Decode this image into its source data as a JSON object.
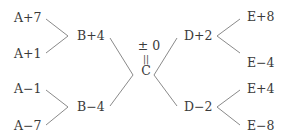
{
  "diagram": {
    "type": "tree",
    "left": {
      "top_group": {
        "leaves": [
          "A+7",
          "A+1"
        ],
        "node": "B+4"
      },
      "bottom_group": {
        "leaves": [
          "A−1",
          "A−7"
        ],
        "node": "B−4"
      }
    },
    "center": {
      "top": "± 0",
      "middle": "||",
      "bottom": "C"
    },
    "right": {
      "top_group": {
        "node": "D+2",
        "leaves": [
          "E+8",
          "E−4"
        ]
      },
      "bottom_group": {
        "node": "D−2",
        "leaves": [
          "E+4",
          "E−8"
        ]
      }
    },
    "line_color": "#8a8a8a",
    "text_color": "#3a3a3a"
  }
}
